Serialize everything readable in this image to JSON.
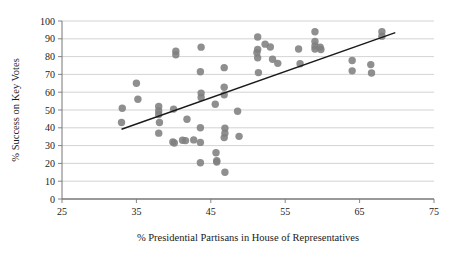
{
  "chart_data": {
    "type": "scatter",
    "title": "",
    "xlabel": "% Presidential Partisans in House of Representatives",
    "ylabel": "% Success on Key Votes",
    "xlim": [
      25,
      75
    ],
    "ylim": [
      0,
      100
    ],
    "xticks": [
      25,
      35,
      45,
      55,
      65,
      75
    ],
    "yticks": [
      0,
      10,
      20,
      30,
      40,
      50,
      60,
      70,
      80,
      90,
      100
    ],
    "xtick_labels": [
      "25",
      "35",
      "45",
      "55",
      "65",
      "75"
    ],
    "ytick_labels": [
      "0",
      "10",
      "20",
      "30",
      "40",
      "50",
      "60",
      "70",
      "80",
      "90",
      "100"
    ],
    "grid": "horizontal",
    "grid_color": "#c8c8c8",
    "marker_color": "#808080",
    "marker_size": 5.2,
    "legend": null,
    "points": [
      {
        "x": 33.1,
        "y": 51.0
      },
      {
        "x": 33.0,
        "y": 43.0
      },
      {
        "x": 35.0,
        "y": 65.0
      },
      {
        "x": 35.2,
        "y": 56.0
      },
      {
        "x": 38.0,
        "y": 52.0
      },
      {
        "x": 38.0,
        "y": 49.5
      },
      {
        "x": 38.0,
        "y": 47.5
      },
      {
        "x": 38.1,
        "y": 43.0
      },
      {
        "x": 38.0,
        "y": 37.0
      },
      {
        "x": 40.0,
        "y": 50.5
      },
      {
        "x": 39.9,
        "y": 32.0
      },
      {
        "x": 40.1,
        "y": 31.5
      },
      {
        "x": 40.3,
        "y": 83.0
      },
      {
        "x": 40.3,
        "y": 81.0
      },
      {
        "x": 41.2,
        "y": 33.0
      },
      {
        "x": 41.6,
        "y": 32.8
      },
      {
        "x": 41.8,
        "y": 44.8
      },
      {
        "x": 42.7,
        "y": 33.2
      },
      {
        "x": 43.7,
        "y": 85.3
      },
      {
        "x": 43.6,
        "y": 71.5
      },
      {
        "x": 43.7,
        "y": 59.5
      },
      {
        "x": 43.7,
        "y": 57.0
      },
      {
        "x": 43.6,
        "y": 40.0
      },
      {
        "x": 43.6,
        "y": 31.8
      },
      {
        "x": 43.6,
        "y": 20.4
      },
      {
        "x": 45.6,
        "y": 53.2
      },
      {
        "x": 45.7,
        "y": 26.0
      },
      {
        "x": 45.8,
        "y": 21.5
      },
      {
        "x": 45.8,
        "y": 20.8
      },
      {
        "x": 46.8,
        "y": 73.8
      },
      {
        "x": 46.8,
        "y": 62.8
      },
      {
        "x": 46.8,
        "y": 58.5
      },
      {
        "x": 46.9,
        "y": 39.8
      },
      {
        "x": 46.9,
        "y": 37.0
      },
      {
        "x": 46.8,
        "y": 34.5
      },
      {
        "x": 46.9,
        "y": 15.0
      },
      {
        "x": 48.6,
        "y": 49.3
      },
      {
        "x": 48.8,
        "y": 35.2
      },
      {
        "x": 51.3,
        "y": 91.0
      },
      {
        "x": 51.3,
        "y": 84.0
      },
      {
        "x": 51.2,
        "y": 82.2
      },
      {
        "x": 51.3,
        "y": 79.3
      },
      {
        "x": 51.4,
        "y": 71.0
      },
      {
        "x": 52.3,
        "y": 87.0
      },
      {
        "x": 53.0,
        "y": 85.4
      },
      {
        "x": 53.3,
        "y": 78.5
      },
      {
        "x": 54.0,
        "y": 76.2
      },
      {
        "x": 56.8,
        "y": 84.3
      },
      {
        "x": 57.0,
        "y": 76.0
      },
      {
        "x": 59.0,
        "y": 94.0
      },
      {
        "x": 59.0,
        "y": 88.5
      },
      {
        "x": 59.0,
        "y": 86.0
      },
      {
        "x": 59.0,
        "y": 84.2
      },
      {
        "x": 59.7,
        "y": 85.3
      },
      {
        "x": 59.8,
        "y": 84.0
      },
      {
        "x": 64.0,
        "y": 77.8
      },
      {
        "x": 64.0,
        "y": 72.0
      },
      {
        "x": 66.5,
        "y": 75.5
      },
      {
        "x": 66.6,
        "y": 70.8
      },
      {
        "x": 68.0,
        "y": 94.0
      },
      {
        "x": 68.0,
        "y": 91.5
      }
    ],
    "trendline": {
      "x0": 33.0,
      "y0": 39.2,
      "x1": 69.8,
      "y1": 93.5,
      "color": "#1a1a1a",
      "width": 1.4
    }
  }
}
